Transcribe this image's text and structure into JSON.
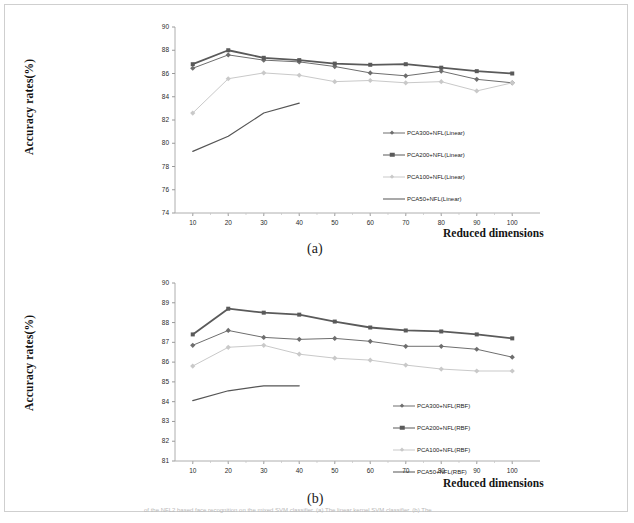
{
  "figure": {
    "panel_a_caption": "(a)",
    "panel_b_caption": "(b)",
    "bottom_caption_fragment": "of the NFL2 based face recognition on the mixed SVM classifier. (a) The linear kernel SVM classifier. (b) The"
  },
  "chart_data": [
    {
      "id": "panel-a",
      "type": "line",
      "title": "",
      "caption": "(a)",
      "xlabel": "Reduced dimensions",
      "ylabel": "Accuracy rates(%)",
      "x": [
        10,
        20,
        30,
        40,
        50,
        60,
        70,
        80,
        90,
        100
      ],
      "xtick_labels": [
        "10",
        "20",
        "30",
        "40",
        "50",
        "60",
        "70",
        "80",
        "90",
        "100"
      ],
      "xlim": [
        5,
        105
      ],
      "ylim": [
        74,
        90
      ],
      "ytick_labels": [
        "74",
        "76",
        "78",
        "80",
        "82",
        "84",
        "86",
        "88",
        "90"
      ],
      "yticks": [
        74,
        76,
        78,
        80,
        82,
        84,
        86,
        88,
        90
      ],
      "grid": false,
      "legend_position": "center-right",
      "series": [
        {
          "name": "PCA300+NFL(Linear)",
          "color": "#6e6e6e",
          "marker": "diamond",
          "marker_size": 2.6,
          "line_width": 1.0,
          "x": [
            10,
            20,
            30,
            40,
            50,
            60,
            70,
            80,
            90,
            100
          ],
          "values": [
            86.45,
            87.6,
            87.15,
            87.0,
            86.6,
            86.05,
            85.8,
            86.2,
            85.5,
            85.2
          ]
        },
        {
          "name": "PCA200+NFL(Linear)",
          "color": "#5a5a5a",
          "marker": "square",
          "marker_size": 4.0,
          "line_width": 1.8,
          "x": [
            10,
            20,
            30,
            40,
            50,
            60,
            70,
            80,
            90,
            100
          ],
          "values": [
            86.8,
            88.0,
            87.35,
            87.15,
            86.85,
            86.75,
            86.8,
            86.5,
            86.2,
            86.0
          ]
        },
        {
          "name": "PCA100+NFL(Linear)",
          "color": "#c9c9c9",
          "marker": "diamond",
          "marker_size": 2.6,
          "line_width": 1.0,
          "x": [
            10,
            20,
            30,
            40,
            50,
            60,
            70,
            80,
            90,
            100
          ],
          "values": [
            82.6,
            85.55,
            86.05,
            85.85,
            85.3,
            85.4,
            85.2,
            85.3,
            84.5,
            85.2
          ]
        },
        {
          "name": "PCA50+NFL(Linear)",
          "color": "#555555",
          "marker": "none",
          "marker_size": 0,
          "line_width": 1.2,
          "x": [
            10,
            20,
            30,
            40
          ],
          "values": [
            79.3,
            80.6,
            82.6,
            83.45
          ]
        }
      ]
    },
    {
      "id": "panel-b",
      "type": "line",
      "title": "",
      "caption": "(b)",
      "xlabel": "Reduced dimensions",
      "ylabel": "Accuracy rates(%)",
      "x": [
        10,
        20,
        30,
        40,
        50,
        60,
        70,
        80,
        90,
        100
      ],
      "xtick_labels": [
        "10",
        "20",
        "30",
        "40",
        "50",
        "60",
        "70",
        "80",
        "90",
        "100"
      ],
      "xlim": [
        5,
        105
      ],
      "ylim": [
        81,
        90
      ],
      "ytick_labels": [
        "81",
        "82",
        "83",
        "84",
        "85",
        "86",
        "87",
        "88",
        "89",
        "90"
      ],
      "yticks": [
        81,
        82,
        83,
        84,
        85,
        86,
        87,
        88,
        89,
        90
      ],
      "grid": false,
      "legend_position": "center-right",
      "series": [
        {
          "name": "PCA300+NFL(RBF)",
          "color": "#6e6e6e",
          "marker": "diamond",
          "marker_size": 2.6,
          "line_width": 1.0,
          "x": [
            10,
            20,
            30,
            40,
            50,
            60,
            70,
            80,
            90,
            100
          ],
          "values": [
            86.85,
            87.6,
            87.25,
            87.15,
            87.2,
            87.05,
            86.8,
            86.8,
            86.65,
            86.25
          ]
        },
        {
          "name": "PCA200+NFL(RBF)",
          "color": "#5a5a5a",
          "marker": "square",
          "marker_size": 4.0,
          "line_width": 1.8,
          "x": [
            10,
            20,
            30,
            40,
            50,
            60,
            70,
            80,
            90,
            100
          ],
          "values": [
            87.4,
            88.7,
            88.5,
            88.4,
            88.05,
            87.75,
            87.6,
            87.55,
            87.4,
            87.2
          ]
        },
        {
          "name": "PCA100+NFL(RBF)",
          "color": "#c9c9c9",
          "marker": "diamond",
          "marker_size": 2.6,
          "line_width": 1.0,
          "x": [
            10,
            20,
            30,
            40,
            50,
            60,
            70,
            80,
            90,
            100
          ],
          "values": [
            85.8,
            86.75,
            86.85,
            86.4,
            86.2,
            86.1,
            85.85,
            85.65,
            85.55,
            85.55
          ]
        },
        {
          "name": "PCA50+NFL(RBF)",
          "color": "#555555",
          "marker": "none",
          "marker_size": 0,
          "line_width": 1.2,
          "x": [
            10,
            20,
            30,
            40
          ],
          "values": [
            84.05,
            84.55,
            84.8,
            84.8
          ]
        }
      ]
    }
  ]
}
